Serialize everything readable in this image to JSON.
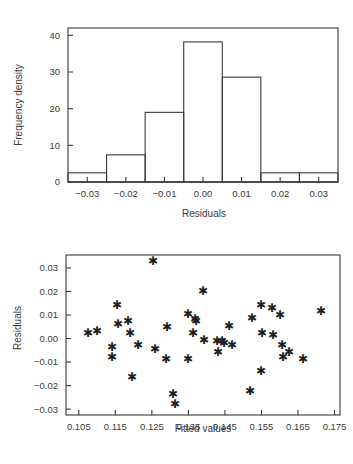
{
  "chart_data": [
    {
      "type": "bar",
      "name": "residuals-histogram",
      "title": "",
      "xlabel": "Residuals",
      "ylabel": "Frequency density",
      "xlim": [
        -0.035,
        0.035
      ],
      "ylim": [
        0,
        42
      ],
      "xticks": [
        -0.03,
        -0.02,
        -0.01,
        0.0,
        0.01,
        0.02,
        0.03
      ],
      "xticklabels": [
        "−0.03",
        "−0.02",
        "−0.01",
        "0.00",
        "0.01",
        "0.02",
        "0.03"
      ],
      "yticks": [
        0,
        10,
        20,
        30,
        40
      ],
      "yticklabels": [
        "0",
        "10",
        "20",
        "30",
        "40"
      ],
      "grid": false,
      "legend": "none",
      "bin_edges": [
        -0.035,
        -0.025,
        -0.015,
        -0.005,
        0.005,
        0.015,
        0.025,
        0.035
      ],
      "categories": [
        "-0.035 to -0.025",
        "-0.025 to -0.015",
        "-0.015 to -0.005",
        "-0.005 to 0.005",
        "0.005 to 0.015",
        "0.015 to 0.025",
        "0.025 to 0.035"
      ],
      "values": [
        2.5,
        7.4,
        19.0,
        38.2,
        28.6,
        2.5,
        2.5
      ]
    },
    {
      "type": "scatter",
      "name": "residuals-vs-fitted",
      "title": "",
      "xlabel": "Fitted values",
      "ylabel": "Residuals",
      "xlim": [
        0.1015,
        0.1765
      ],
      "ylim": [
        -0.0325,
        0.0355
      ],
      "xticks": [
        0.105,
        0.115,
        0.125,
        0.135,
        0.145,
        0.155,
        0.165,
        0.175
      ],
      "xticklabels": [
        "0.105",
        "0.115",
        "0.125",
        "0.135",
        "0.145",
        "0.155",
        "0.165",
        "0.175"
      ],
      "yticks": [
        -0.03,
        -0.02,
        -0.01,
        0.0,
        0.01,
        0.02,
        0.03
      ],
      "yticklabels": [
        "−0.03",
        "−0.02",
        "−0.01",
        "0.00",
        "0.01",
        "0.02",
        "0.03"
      ],
      "grid": false,
      "legend": "none",
      "marker": "asterisk",
      "points": [
        [
          0.1075,
          0.002
        ],
        [
          0.11,
          0.0027
        ],
        [
          0.114,
          -0.004
        ],
        [
          0.1142,
          -0.0082
        ],
        [
          0.1155,
          0.014
        ],
        [
          0.1158,
          0.006
        ],
        [
          0.1185,
          0.007
        ],
        [
          0.119,
          0.002
        ],
        [
          0.1195,
          -0.0168
        ],
        [
          0.1212,
          -0.0032
        ],
        [
          0.1252,
          0.0328
        ],
        [
          0.1258,
          -0.0046
        ],
        [
          0.1288,
          -0.009
        ],
        [
          0.1292,
          0.0044
        ],
        [
          0.1308,
          -0.024
        ],
        [
          0.1312,
          -0.0282
        ],
        [
          0.1348,
          0.01
        ],
        [
          0.135,
          -0.009
        ],
        [
          0.1362,
          0.002
        ],
        [
          0.1368,
          0.0078
        ],
        [
          0.1372,
          0.0072
        ],
        [
          0.139,
          0.02
        ],
        [
          0.1392,
          -0.001
        ],
        [
          0.1428,
          -0.0014
        ],
        [
          0.143,
          -0.006
        ],
        [
          0.1442,
          -0.0012
        ],
        [
          0.1448,
          -0.0022
        ],
        [
          0.1462,
          0.005
        ],
        [
          0.147,
          -0.003
        ],
        [
          0.1518,
          -0.0228
        ],
        [
          0.1525,
          0.0082
        ],
        [
          0.1548,
          0.014
        ],
        [
          0.155,
          -0.014
        ],
        [
          0.1552,
          0.002
        ],
        [
          0.1578,
          0.0128
        ],
        [
          0.1582,
          0.0012
        ],
        [
          0.1602,
          0.0098
        ],
        [
          0.1605,
          -0.003
        ],
        [
          0.1608,
          -0.0082
        ],
        [
          0.1625,
          -0.0062
        ],
        [
          0.1665,
          -0.009
        ],
        [
          0.1712,
          0.0115
        ]
      ]
    }
  ],
  "histogram": {
    "xlabel": "Residuals",
    "ylabel": "Frequency density"
  },
  "scatter": {
    "xlabel": "Fitted values",
    "ylabel": "Residuals"
  },
  "marker_glyph": "✱"
}
